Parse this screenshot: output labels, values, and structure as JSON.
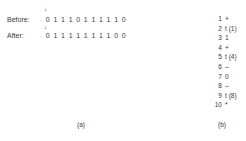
{
  "panel_a": {
    "before": {
      "label": "Before:",
      "bits": [
        "0",
        "1",
        "1",
        "1",
        "0",
        "1",
        "1",
        "1",
        "1",
        "1",
        "0"
      ]
    },
    "after": {
      "label": "After:",
      "bits": [
        "0",
        "1",
        "1",
        "1",
        "1",
        "1",
        "1",
        "1",
        "1",
        "0",
        "0"
      ]
    },
    "pointer_glyph": "↓",
    "caption": "(a)"
  },
  "panel_b": {
    "items": [
      {
        "num": "1",
        "text": "+"
      },
      {
        "num": "2",
        "text": "t (1)"
      },
      {
        "num": "3",
        "text": "1"
      },
      {
        "num": "4",
        "text": "+"
      },
      {
        "num": "5",
        "text": "t (4)"
      },
      {
        "num": "6",
        "text": "–"
      },
      {
        "num": "7",
        "text": "0"
      },
      {
        "num": "8",
        "text": "–"
      },
      {
        "num": "9",
        "text": "t (8)"
      },
      {
        "num": "10",
        "text": "*"
      }
    ],
    "caption": "(b)"
  }
}
